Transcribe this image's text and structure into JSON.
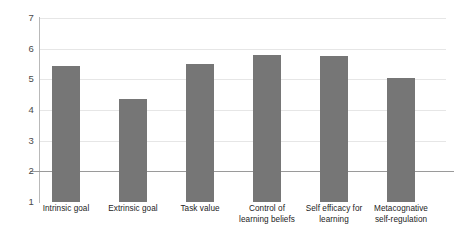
{
  "chart_data": {
    "type": "bar",
    "title": "",
    "subtitle": "",
    "xlabel": "",
    "ylabel": "",
    "ylim": [
      1,
      7
    ],
    "yticks": [
      1,
      2,
      3,
      4,
      5,
      6,
      7
    ],
    "ytick_labels": [
      "1",
      "2",
      "3",
      "4",
      "5",
      "6",
      "7"
    ],
    "grid": true,
    "grid_axis": "y",
    "legend": false,
    "legend_position": "none",
    "bar_color": "#767676",
    "gridline_color": "#e6e6e6",
    "axis_color": "#b9b9b9",
    "categories": [
      "Intrinsic  goal",
      "Extrinsic goal",
      "Task value",
      "Control of learning beliefs",
      "Self efficacy for learning",
      "Metacognative self-regulation"
    ],
    "category_label_lines": [
      [
        "Intrinsic  goal",
        ""
      ],
      [
        "Extrinsic goal",
        ""
      ],
      [
        "Task value",
        ""
      ],
      [
        "Control of",
        "learning beliefs"
      ],
      [
        "Self efficacy for",
        "learning"
      ],
      [
        "Metacognative",
        "self-regulation"
      ]
    ],
    "values": [
      5.45,
      4.35,
      5.5,
      5.8,
      5.75,
      5.03
    ]
  }
}
